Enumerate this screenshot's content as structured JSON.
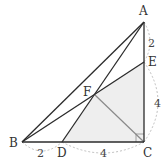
{
  "diagram": {
    "type": "geometry",
    "points": {
      "A": {
        "label": "A",
        "x": 144,
        "y": 22
      },
      "E": {
        "label": "E",
        "x": 144,
        "y": 62
      },
      "C": {
        "label": "C",
        "x": 144,
        "y": 142
      },
      "B": {
        "label": "B",
        "x": 22,
        "y": 142
      },
      "D": {
        "label": "D",
        "x": 62,
        "y": 142
      },
      "F": {
        "label": "F",
        "x": 95,
        "y": 95
      }
    },
    "segments": [
      "AB",
      "AC",
      "BC",
      "BE",
      "AD",
      "FC"
    ],
    "shaded_region": [
      "F",
      "E",
      "C",
      "D"
    ],
    "right_angle_at": "C",
    "measures": [
      {
        "from": "A",
        "to": "E",
        "value": "2"
      },
      {
        "from": "E",
        "to": "C",
        "value": "4"
      },
      {
        "from": "B",
        "to": "D",
        "value": "2"
      },
      {
        "from": "D",
        "to": "C",
        "value": "4"
      }
    ],
    "colors": {
      "line": "#2b2b2b",
      "gray_line": "#8a8a8a",
      "shade": "#eeeeee",
      "dashed": "#b0b0b0"
    }
  }
}
